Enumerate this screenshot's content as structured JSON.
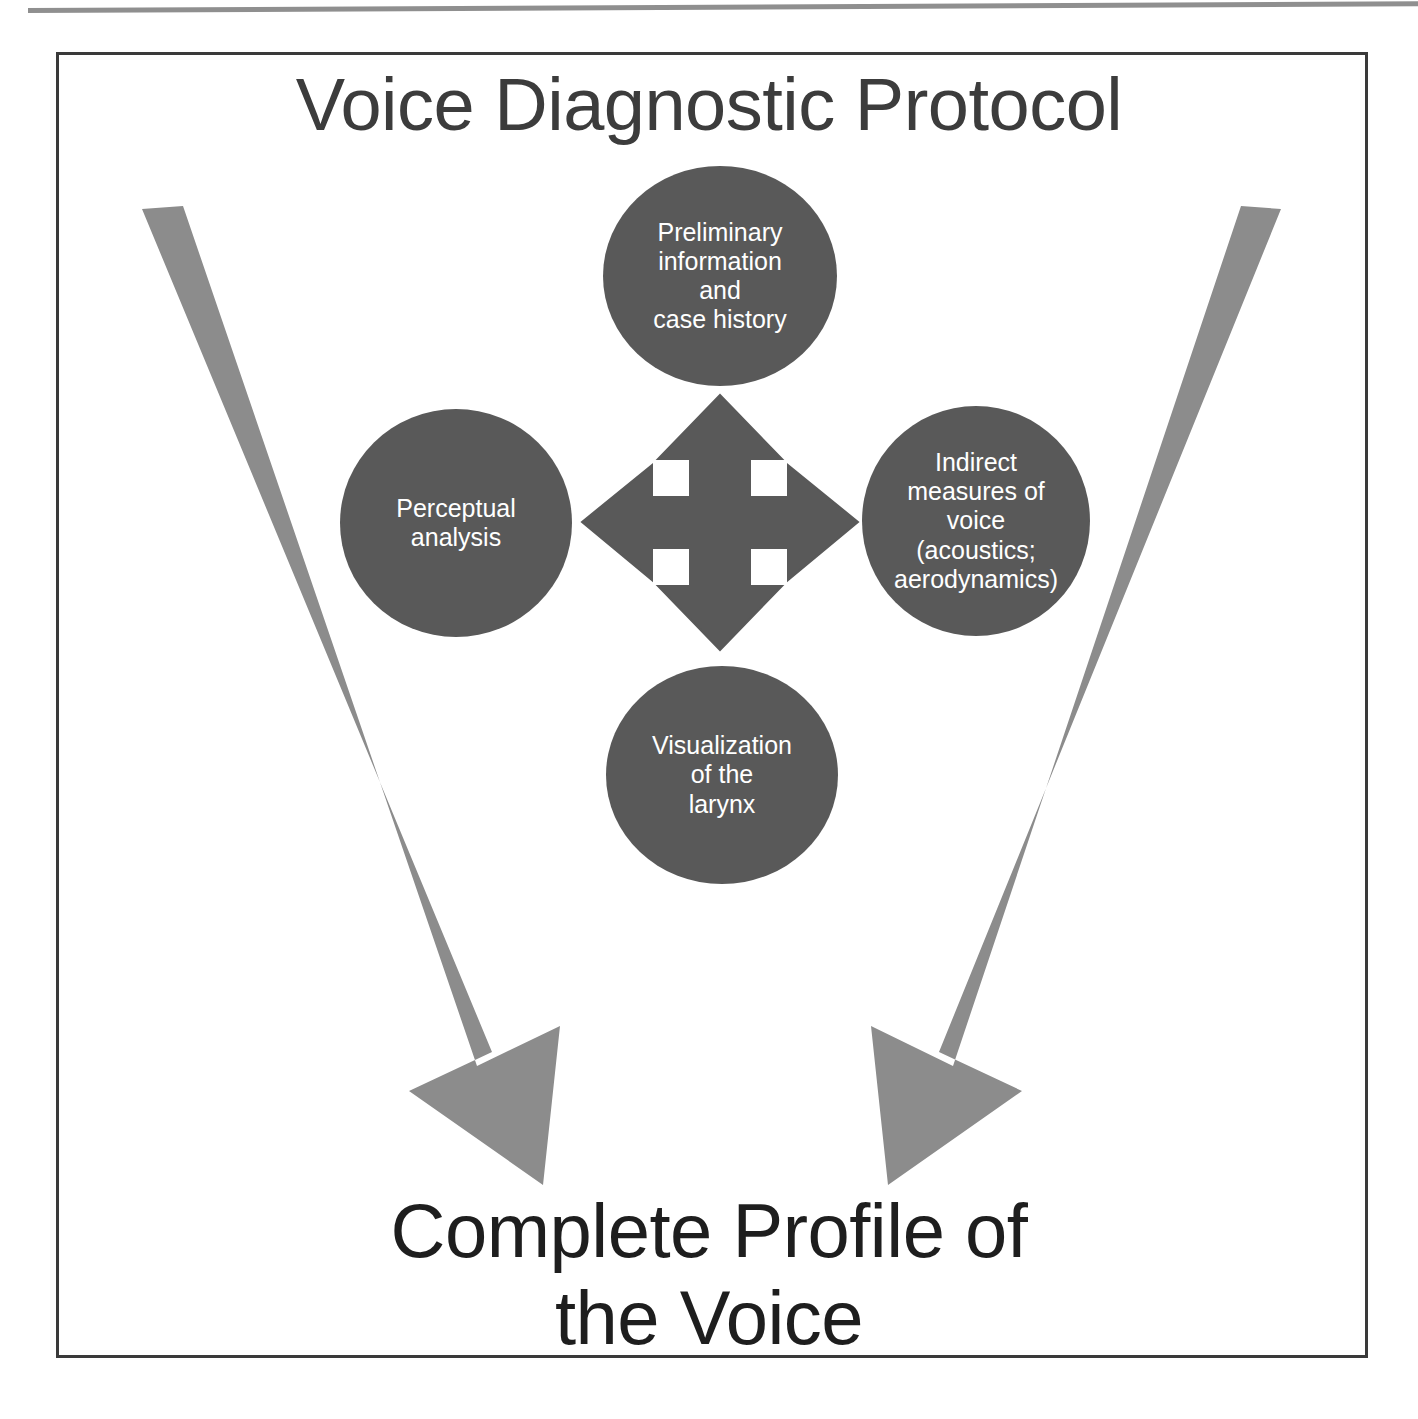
{
  "figure": {
    "title": "Voice Diagnostic Protocol",
    "outcome": "Complete Profile of\nthe Voice",
    "colors": {
      "node_fill": "#595959",
      "node_text": "#ffffff",
      "big_arrow": "#8c8c8c",
      "cross_arrow": "#595959",
      "frame_border": "#3a3a3a",
      "title_text": "#3c3c3c",
      "outcome_text": "#1e1e1e",
      "background": "#ffffff"
    },
    "nodes": [
      {
        "id": "preliminary",
        "label": "Preliminary\ninformation\nand\ncase history"
      },
      {
        "id": "perceptual",
        "label": "Perceptual\nanalysis"
      },
      {
        "id": "indirect",
        "label": "Indirect\nmeasures of\nvoice\n(acoustics;\naerodynamics)"
      },
      {
        "id": "visualization",
        "label": "Visualization\nof the\nlarynx"
      }
    ],
    "center_icon": "four-way-arrow-icon",
    "flow_arrows": [
      {
        "id": "left-sweep",
        "direction": "down-right",
        "from": "top-left",
        "to": "outcome"
      },
      {
        "id": "right-sweep",
        "direction": "down-left",
        "from": "top-right",
        "to": "outcome"
      }
    ]
  }
}
